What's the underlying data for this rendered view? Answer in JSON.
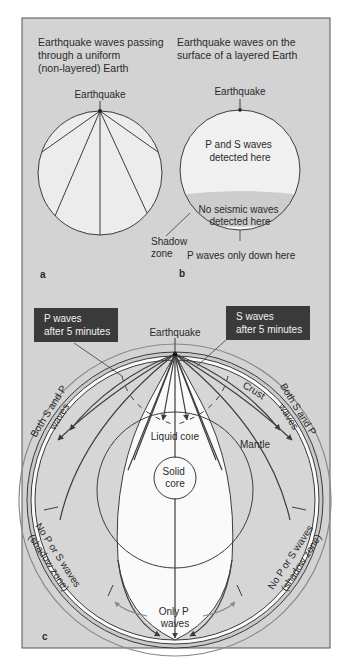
{
  "panel_a": {
    "title_lines": [
      "Earthquake waves passing",
      "through a uniform",
      "(non-layered) Earth"
    ],
    "earthquake_label": "Earthquake",
    "letter": "a"
  },
  "panel_b": {
    "title_lines": [
      "Earthquake waves on the",
      "surface of a layered Earth"
    ],
    "earthquake_label": "Earthquake",
    "detected_lines": [
      "P and S waves",
      "detected here"
    ],
    "none_lines": [
      "No seismic waves",
      "detected here"
    ],
    "shadow_lines": [
      "Shadow",
      "zone"
    ],
    "p_only": "P waves only down here",
    "letter": "b"
  },
  "panel_c": {
    "earthquake_label": "Earthquake",
    "p_box_lines": [
      "P waves",
      "after 5 minutes"
    ],
    "s_box_lines": [
      "S waves",
      "after 5 minutes"
    ],
    "crust": "Crust",
    "mantle": "Mantle",
    "liquid_core": "Liquid coıe",
    "solid_core_lines": [
      "Solid",
      "core"
    ],
    "both_left_lines": [
      "Both S and P",
      "waves"
    ],
    "both_right_lines": [
      "Both S and P",
      "waves"
    ],
    "shadow_left_lines": [
      "No P or S waves",
      "(shadow zone)"
    ],
    "shadow_right_lines": [
      "No P or S waves",
      "(shadow zone)"
    ],
    "only_p_lines": [
      "Only P",
      "waves"
    ],
    "letter": "c"
  },
  "colors": {
    "panel_bg": "#d3d3d3",
    "box_dark": "#3a3a3a",
    "line": "#3c3c3c",
    "shadow_zone": "#c6c6c6",
    "white": "#fafafa"
  }
}
